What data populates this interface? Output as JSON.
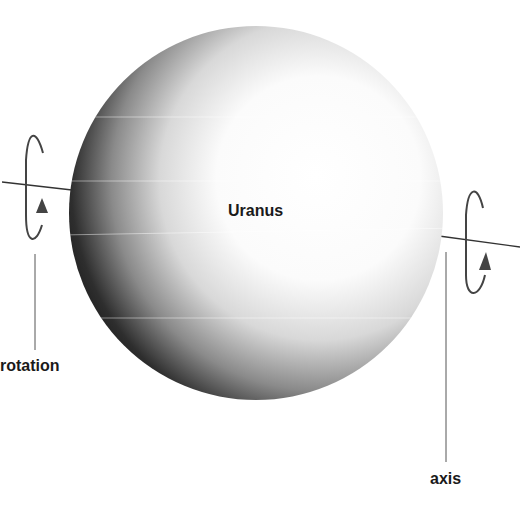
{
  "diagram": {
    "planet": {
      "name": "Uranus"
    },
    "labels": {
      "rotation": "rotation",
      "axis": "axis"
    },
    "icons": {
      "left_rotation_arrow": "rotation-arrow-icon",
      "right_rotation_arrow": "rotation-arrow-icon"
    },
    "colors": {
      "background": "#ffffff",
      "sphere_dark": "#0d0d0d",
      "sphere_light": "#ffffff",
      "lines": "#333333",
      "text": "#1a1a1a"
    }
  }
}
